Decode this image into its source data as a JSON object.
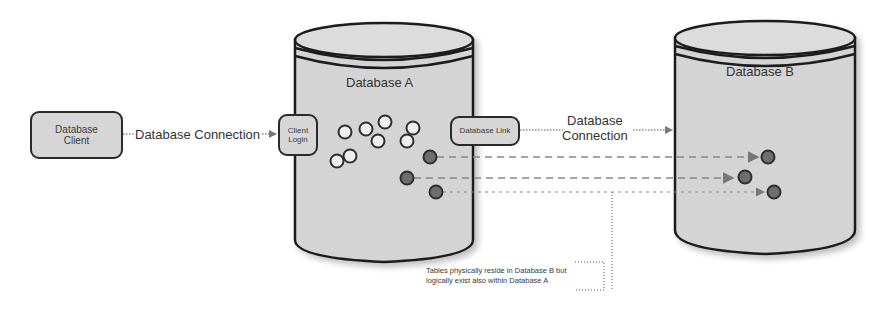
{
  "diagram": {
    "type": "database-link architecture",
    "colors": {
      "cylinder_fill": "#d4d4d4",
      "outline": "#1e1e1e",
      "box_fill": "#d6d6d6",
      "empty_table_fill": "#eeeeee",
      "linked_table_fill": "#6e6e6e",
      "arrow": "#777777"
    },
    "database_client": {
      "label_line1": "Database",
      "label_line2": "Client"
    },
    "client_connection": {
      "label": "Database Connection"
    },
    "database_a": {
      "title": "Database A",
      "client_login": {
        "label_line1": "Client",
        "label_line2": "Login"
      },
      "database_link": {
        "label": "Database Link"
      },
      "local_tables": 9,
      "linked_tables": 3
    },
    "link_connection": {
      "label_line1": "Database",
      "label_line2": "Connection"
    },
    "database_b": {
      "title": "Database B",
      "tables": 3
    },
    "annotation": {
      "line1": "Tables physically reside in Database B but",
      "line2": "logically exist also within Database A"
    }
  }
}
